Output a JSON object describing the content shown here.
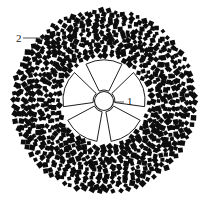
{
  "figure": {
    "background_color": "#ffffff",
    "width": 207,
    "height": 204,
    "canvas": {
      "center_x": 104,
      "center_y": 101,
      "outer_radius": 93
    },
    "callouts": [
      {
        "id": "callout-1",
        "label": "1",
        "label_x": 127,
        "label_y": 105,
        "target": "rotor-hub",
        "leader_from_x": 124,
        "leader_from_y": 102,
        "leader_to_x": 113,
        "leader_to_y": 102
      },
      {
        "id": "callout-2",
        "label": "2",
        "label_x": 16,
        "label_y": 42,
        "target": "particle-field",
        "leader_from_x": 23,
        "leader_from_y": 38,
        "leader_to_x": 45,
        "leader_to_y": 38
      }
    ],
    "rotor": {
      "name": "five-blade-rotor",
      "blade_count": 5,
      "hub_radius": 9.5,
      "blade_inner_radius": 11,
      "blade_outer_radius": 41,
      "blade_angular_width_deg": 52,
      "start_angle_deg": -90,
      "fill_color": "#ffffff",
      "stroke_color": "#1f1f1f"
    },
    "particle_field": {
      "name": "concentric-diamond-field",
      "shape": "diamond",
      "color": "#0d0d0d",
      "inner_radius": 44,
      "outer_radius": 92,
      "ring_count": 12,
      "ring_spacing": 4.2,
      "marker_size": 4.6,
      "jitter": 1.5,
      "rings": [
        {
          "radius": 46,
          "count": 44
        },
        {
          "radius": 50,
          "count": 48
        },
        {
          "radius": 54,
          "count": 52
        },
        {
          "radius": 58,
          "count": 56
        },
        {
          "radius": 62,
          "count": 60
        },
        {
          "radius": 66,
          "count": 62
        },
        {
          "radius": 70,
          "count": 66
        },
        {
          "radius": 74,
          "count": 70
        },
        {
          "radius": 78,
          "count": 72
        },
        {
          "radius": 82,
          "count": 74
        },
        {
          "radius": 86,
          "count": 76
        },
        {
          "radius": 90,
          "count": 78
        }
      ]
    }
  },
  "caption": {
    "text": "",
    "visible": false
  }
}
